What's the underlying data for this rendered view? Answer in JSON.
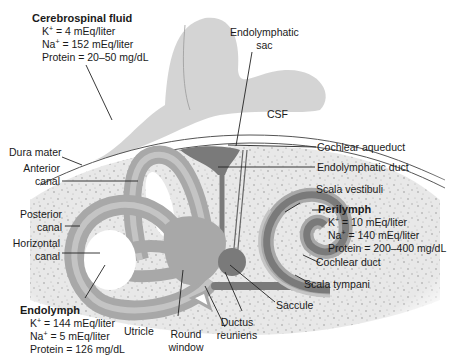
{
  "diagram": {
    "type": "anatomical-diagram",
    "colors": {
      "brain": "#cfcfcf",
      "bone": "#e6e6e6",
      "bone_speckle": "#9a9a9a",
      "membranous_dark": "#7a7a7a",
      "membranous_mid": "#a8a8a8",
      "membranous_light": "#c4c4c4",
      "line": "#222222",
      "text": "#1a1a1a"
    }
  },
  "fluids": {
    "csf": {
      "title": "Cerebrospinal fluid",
      "rows": [
        {
          "ion": "K",
          "charge": "+",
          "value": " = 4 mEq/liter"
        },
        {
          "ion": "Na",
          "charge": "+",
          "value": " = 152 mEq/liter"
        },
        {
          "ion": "Protein",
          "charge": "",
          "value": " = 20–50 mg/dL"
        }
      ]
    },
    "perilymph": {
      "title": "Perilymph",
      "rows": [
        {
          "ion": "K",
          "charge": "+",
          "value": " = 10 mEq/liter"
        },
        {
          "ion": "Na",
          "charge": "+",
          "value": " = 140 mEq/liter"
        },
        {
          "ion": "Protein",
          "charge": "",
          "value": " = 200–400 mg/dL"
        }
      ]
    },
    "endolymph": {
      "title": "Endolymph",
      "rows": [
        {
          "ion": "K",
          "charge": "+",
          "value": " = 144 mEq/liter"
        },
        {
          "ion": "Na",
          "charge": "+",
          "value": " = 5 mEq/liter"
        },
        {
          "ion": "Protein",
          "charge": "",
          "value": " = 126 mg/dL"
        }
      ]
    }
  },
  "labels": {
    "endolymphatic_sac_1": "Endolymphatic",
    "endolymphatic_sac_2": "sac",
    "csf": "CSF",
    "dura_mater": "Dura mater",
    "anterior_canal_1": "Anterior",
    "anterior_canal_2": "canal",
    "posterior_canal_1": "Posterior",
    "posterior_canal_2": "canal",
    "horizontal_canal_1": "Horizontal",
    "horizontal_canal_2": "canal",
    "cochlear_aqueduct": "Cochlear aqueduct",
    "endolymphatic_duct": "Endolymphatic duct",
    "scala_vestibuli": "Scala vestibuli",
    "cochlear_duct": "Cochlear duct",
    "scala_tympani": "Scala tympani",
    "saccule": "Saccule",
    "ductus_reuniens_1": "Ductus",
    "ductus_reuniens_2": "reuniens",
    "round_window_1": "Round",
    "round_window_2": "window",
    "utricle": "Utricle"
  }
}
